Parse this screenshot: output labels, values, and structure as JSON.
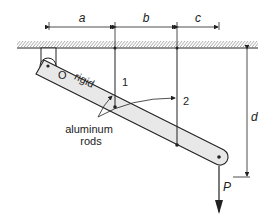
{
  "figure": {
    "type": "mechanics diagram",
    "dimensions": {
      "a": "a",
      "b": "b",
      "c": "c",
      "d": "d"
    },
    "labels": {
      "pin": "O",
      "bar": "rigid",
      "rod1": "1",
      "rod2": "2",
      "rods_line1": "aluminum",
      "rods_line2": "rods",
      "load": "P"
    },
    "colors": {
      "line": "#222222",
      "bar_fill": "#e8e8e8",
      "hatch": "#555555"
    }
  }
}
